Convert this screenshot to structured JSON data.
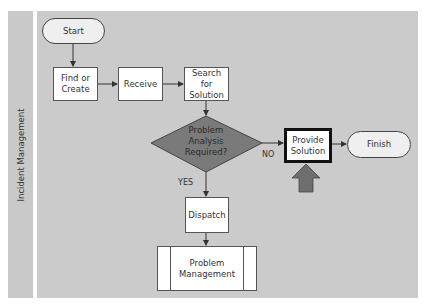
{
  "lane": {
    "label": "Incident Management"
  },
  "nodes": {
    "start": "Start",
    "find_or_create": "Find or Create",
    "receive": "Receive",
    "search_for_solution": "Search for Solution",
    "decision": "Problem Analysis Required?",
    "provide_solution": "Provide Solution",
    "finish": "Finish",
    "dispatch": "Dispatch",
    "problem_management": "Problem Management"
  },
  "edges": {
    "yes_label": "YES",
    "no_label": "NO"
  },
  "colors": {
    "lane_background": "#cbcbcb",
    "lane_label_background": "#c9c9c9",
    "decision_fill": "#7a7a7a",
    "highlight_arrow_fill": "#6e6e6e",
    "node_fill": "#ffffff",
    "terminal_fill": "#efefef"
  }
}
